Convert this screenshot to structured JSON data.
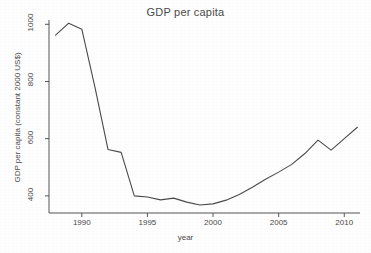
{
  "chart_data": {
    "type": "line",
    "title": "GDP per capita",
    "xlabel": "year",
    "ylabel": "GDP per capita (constant 2000 US$)",
    "xlim": [
      1987.5,
      2011.2
    ],
    "ylim": [
      340,
      1015
    ],
    "grid": false,
    "legend": "none",
    "x_ticks": [
      1990,
      1995,
      2000,
      2005,
      2010
    ],
    "x_tick_labels": [
      "1990",
      "1995",
      "2000",
      "2005",
      "2010"
    ],
    "y_ticks": [
      400,
      600,
      800,
      1000
    ],
    "y_tick_labels": [
      "400",
      "600",
      "800",
      "1000"
    ],
    "line_color": "#4a4a4a",
    "series": [
      {
        "name": "GDP per capita (constant 2000 US$)",
        "x": [
          1988,
          1989,
          1990,
          1991,
          1992,
          1993,
          1994,
          1995,
          1996,
          1997,
          1998,
          1999,
          2000,
          2001,
          2002,
          2003,
          2004,
          2005,
          2006,
          2007,
          2008,
          2009,
          2010,
          2011
        ],
        "values": [
          962,
          1004,
          983,
          780,
          562,
          552,
          400,
          396,
          386,
          392,
          378,
          368,
          372,
          385,
          405,
          430,
          458,
          483,
          510,
          548,
          595,
          560,
          600,
          640
        ]
      }
    ]
  },
  "axes": {
    "title_text": "GDP per capita",
    "x_title": "year",
    "y_title": "GDP per capita (constant 2000 US$)"
  }
}
